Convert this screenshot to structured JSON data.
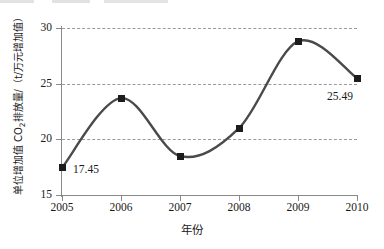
{
  "chart_data": {
    "type": "line",
    "title": "",
    "xlabel": "年份",
    "ylabel": "单位增加值 CO2排放量/（t/万元增加值）",
    "ylabel_parts": {
      "pre": "单位增加值 CO",
      "sub": "2",
      "post": "排放量/（t/万元增加值）"
    },
    "x": [
      2005,
      2006,
      2007,
      2008,
      2009,
      2010
    ],
    "xticklabels": [
      "2005",
      "2006",
      "2007",
      "2008",
      "2009",
      "2010"
    ],
    "values": [
      17.45,
      23.7,
      18.5,
      21.0,
      28.8,
      25.49
    ],
    "yticks": [
      15,
      20,
      25,
      30
    ],
    "yticklabels": [
      "15",
      "20",
      "25",
      "30"
    ],
    "ylim": [
      15,
      30
    ],
    "xlim": [
      2005,
      2010
    ],
    "grid": "horizontal-dashed",
    "legend": "none",
    "line_color": "#4a4a4a",
    "marker_color": "#1c1c1c",
    "marker_shape": "square",
    "smoothing": "spline",
    "annotations": [
      {
        "text": "17.45",
        "x": 2005,
        "y": 17.45
      },
      {
        "text": "25.49",
        "x": 2010,
        "y": 25.49
      }
    ]
  },
  "axis": {
    "y_ticks": [
      {
        "label": "30",
        "top": 28
      },
      {
        "label": "25",
        "top": 84
      },
      {
        "label": "20",
        "top": 139
      },
      {
        "label": "15",
        "top": 195
      }
    ],
    "x_ticks": [
      {
        "label": "2005",
        "left": 62
      },
      {
        "label": "2006",
        "left": 121
      },
      {
        "label": "2007",
        "left": 180
      },
      {
        "label": "2008",
        "left": 239
      },
      {
        "label": "2009",
        "left": 298
      },
      {
        "label": "2010",
        "left": 357
      }
    ]
  },
  "point_labels": {
    "first": "17.45",
    "last": "25.49"
  }
}
